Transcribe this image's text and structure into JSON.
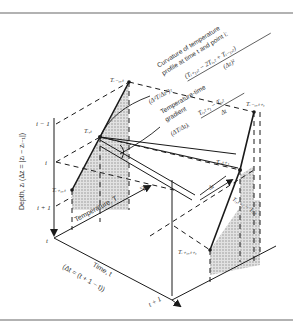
{
  "figure": {
    "axes": {
      "depth_label": "Depth, zᵢ (Δz = |zᵢ − zᵢ₋₁|)",
      "time_label": "Time, t",
      "time_sub_label": "(Δt = (t + 1 − t))",
      "temperature_label": "Temperature, T"
    },
    "depth_ticks": [
      "i − 1",
      "i",
      "i + 1"
    ],
    "time_ticks": [
      "t",
      "t + 1"
    ],
    "points": {
      "t_im1_t": "Tᵢ₋₁,ₜ",
      "t_i_t": "Tᵢ,ₜ",
      "t_ip1_t": "Tᵢ₊₁,ₜ",
      "t_im1_tp1": "Tᵢ₋₁,ₜ₊₁",
      "t_i_tp1": "Tᵢ,ₜ₊₁",
      "t_ip1_tp1": "Tᵢ₊₁,ₜ₊₁"
    },
    "annotations": {
      "curvature_title_1": "Curvature of temperature",
      "curvature_title_2": "profile at time t and point i:",
      "curvature_lhs": "(Δ²T/Δz²)ₜ",
      "curvature_rhs_num": "(Tᵢ₊₁,ₜ − 2Tᵢ,ₜ + Tᵢ₋₁,ₜ)",
      "curvature_rhs_den": "(Δz)²",
      "gradient_title_1": "Temperature-time",
      "gradient_title_2": "gradient",
      "gradient_lhs": "(ΔT/Δt)ᵢ",
      "gradient_rhs_num": "Tᵢ,ₜ₊₁ − Tᵢ,ₜ",
      "gradient_rhs_den": "Δt",
      "delta_t_label": "Δt",
      "diff_label": "Tᵢ,ₜ₊₁ − Tᵢ,ₜ"
    },
    "colors": {
      "line": "#1a1a1a",
      "shade": "#c8c8c8",
      "border": "#555555"
    }
  }
}
